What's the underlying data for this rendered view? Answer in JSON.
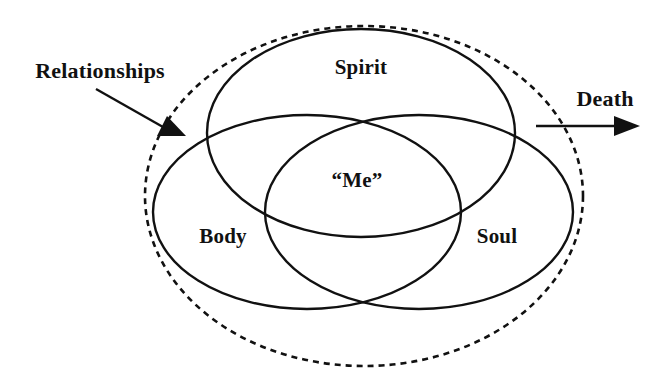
{
  "diagram": {
    "background_color": "#ffffff",
    "stroke_color": "#111111",
    "labels": {
      "spirit": "Spirit",
      "body": "Body",
      "soul": "Soul",
      "center": "“Me”",
      "relationships": "Relationships",
      "death": "Death"
    },
    "sets": [
      {
        "name": "Spirit",
        "position": "top"
      },
      {
        "name": "Body",
        "position": "bottom-left"
      },
      {
        "name": "Soul",
        "position": "bottom-right"
      }
    ],
    "intersection_label": "“Me”",
    "boundary": {
      "style": "dashed",
      "label": "Relationships"
    },
    "annotations": [
      {
        "label": "Relationships",
        "arrow": "points-down-right-to-dashed-boundary"
      },
      {
        "label": "Death",
        "arrow": "points-right-away-from-boundary"
      }
    ]
  }
}
